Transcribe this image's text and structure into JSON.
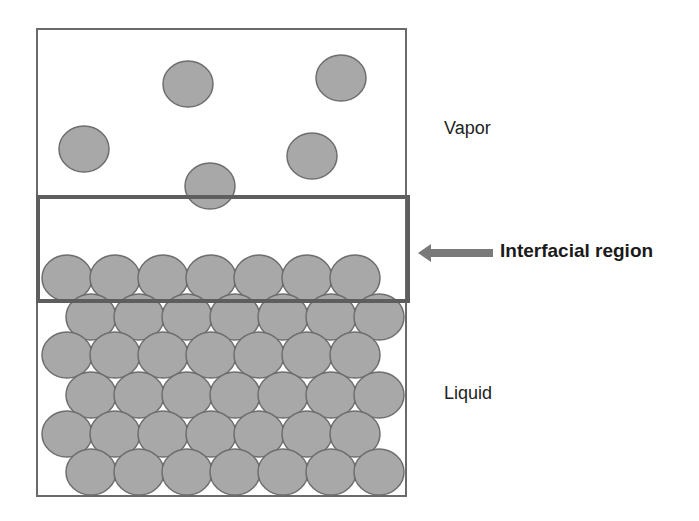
{
  "figure": {
    "width": 699,
    "height": 521,
    "background": "#ffffff"
  },
  "labels": {
    "vapor": "Vapor",
    "interfacial": "Interfacial region",
    "liquid": "Liquid"
  },
  "colors": {
    "molecule_fill": "#a8a8a8",
    "molecule_stroke": "#6e6e6e",
    "container_stroke": "#6a6a6a",
    "interface_box_stroke": "#5e5e5e",
    "arrow_fill": "#7a7a7a",
    "text": "#222222"
  },
  "container": {
    "x": 37,
    "y": 29,
    "width": 369,
    "height": 467,
    "stroke_width": 2
  },
  "interface_box": {
    "x": 38,
    "y": 197,
    "width": 370,
    "height": 104,
    "stroke_width": 4
  },
  "arrow": {
    "tip_x": 418,
    "tip_y": 253,
    "head_back_x": 431,
    "head_half_height": 9,
    "shaft_end_x": 493,
    "shaft_half_height": 4
  },
  "molecules": {
    "rx": 25,
    "ry": 23,
    "vapor": [
      {
        "cx": 188,
        "cy": 84
      },
      {
        "cx": 341,
        "cy": 78
      },
      {
        "cx": 84,
        "cy": 149
      },
      {
        "cx": 312,
        "cy": 156
      },
      {
        "cx": 210,
        "cy": 186
      }
    ],
    "liquid_rows": [
      {
        "cy": 278,
        "start_x": 67,
        "count": 7,
        "spacing": 48
      },
      {
        "cy": 317,
        "start_x": 91,
        "count": 7,
        "spacing": 48
      },
      {
        "cy": 355,
        "start_x": 67,
        "count": 7,
        "spacing": 48
      },
      {
        "cy": 395,
        "start_x": 91,
        "count": 7,
        "spacing": 48
      },
      {
        "cy": 434,
        "start_x": 67,
        "count": 7,
        "spacing": 48
      },
      {
        "cy": 472,
        "start_x": 91,
        "count": 7,
        "spacing": 48
      }
    ]
  }
}
